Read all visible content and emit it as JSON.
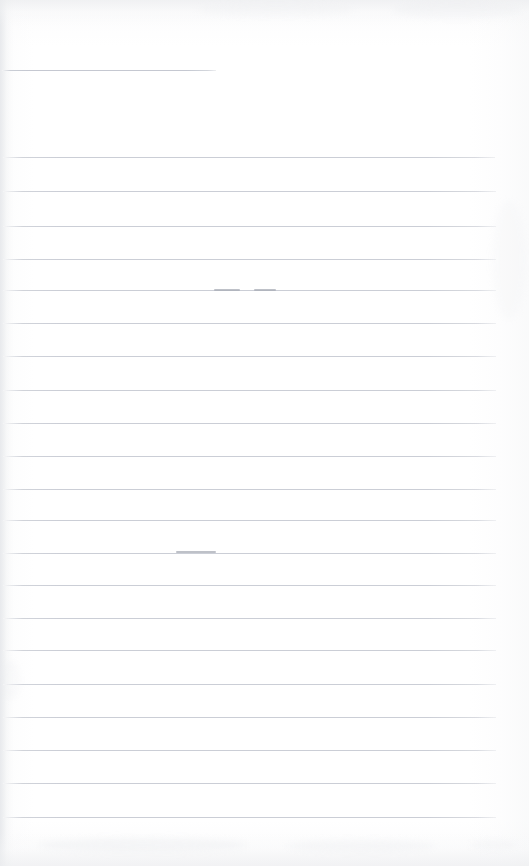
{
  "document": {
    "title": "Scanned ruled notebook page",
    "kind": "lined-paper-scan",
    "page_width": 529,
    "page_height": 866,
    "text_content": "",
    "has_handwriting": false,
    "note": ""
  },
  "colors": {
    "paper": "#fefeff",
    "rule_line": "#c9ccd4",
    "rule_line_short": "#c2c6cf",
    "pencil_mark": "#a8acb5",
    "scan_band": "#ecedef",
    "gutter_shadow": "#e5e7ea"
  },
  "layout": {
    "rule_left": 4,
    "rule_right": 496,
    "rule_thickness": 1,
    "line_spacing": 33
  },
  "rules": [
    {
      "id": "rule-header",
      "y": 70,
      "x": 2,
      "width": 214,
      "kind": "short"
    },
    {
      "id": "rule-1",
      "y": 157,
      "x": 3,
      "width": 492,
      "kind": "full"
    },
    {
      "id": "rule-2",
      "y": 191,
      "x": 3,
      "width": 493,
      "kind": "full"
    },
    {
      "id": "rule-3",
      "y": 226,
      "x": 3,
      "width": 493,
      "kind": "full"
    },
    {
      "id": "rule-4",
      "y": 259,
      "x": 3,
      "width": 493,
      "kind": "full"
    },
    {
      "id": "rule-5",
      "y": 290,
      "x": 3,
      "width": 493,
      "kind": "full"
    },
    {
      "id": "rule-6",
      "y": 323,
      "x": 3,
      "width": 493,
      "kind": "full"
    },
    {
      "id": "rule-7",
      "y": 356,
      "x": 3,
      "width": 493,
      "kind": "full"
    },
    {
      "id": "rule-8",
      "y": 390,
      "x": 3,
      "width": 493,
      "kind": "full"
    },
    {
      "id": "rule-9",
      "y": 423,
      "x": 3,
      "width": 493,
      "kind": "full"
    },
    {
      "id": "rule-10",
      "y": 456,
      "x": 3,
      "width": 493,
      "kind": "full"
    },
    {
      "id": "rule-11",
      "y": 489,
      "x": 3,
      "width": 493,
      "kind": "full"
    },
    {
      "id": "rule-12",
      "y": 520,
      "x": 3,
      "width": 493,
      "kind": "full"
    },
    {
      "id": "rule-13",
      "y": 553,
      "x": 3,
      "width": 493,
      "kind": "full"
    },
    {
      "id": "rule-14",
      "y": 585,
      "x": 3,
      "width": 493,
      "kind": "full"
    },
    {
      "id": "rule-15",
      "y": 618,
      "x": 3,
      "width": 493,
      "kind": "full"
    },
    {
      "id": "rule-16",
      "y": 650,
      "x": 3,
      "width": 493,
      "kind": "full"
    },
    {
      "id": "rule-17",
      "y": 684,
      "x": 3,
      "width": 493,
      "kind": "full"
    },
    {
      "id": "rule-18",
      "y": 717,
      "x": 3,
      "width": 493,
      "kind": "full"
    },
    {
      "id": "rule-19",
      "y": 750,
      "x": 3,
      "width": 493,
      "kind": "full"
    },
    {
      "id": "rule-20",
      "y": 783,
      "x": 3,
      "width": 493,
      "kind": "full"
    },
    {
      "id": "rule-21",
      "y": 817,
      "x": 3,
      "width": 493,
      "kind": "full"
    }
  ],
  "pencil_marks": [
    {
      "id": "mark-1",
      "x": 214,
      "y": 289,
      "width": 26
    },
    {
      "id": "mark-2",
      "x": 254,
      "y": 289,
      "width": 22
    },
    {
      "id": "mark-3",
      "x": 176,
      "y": 551,
      "width": 40
    }
  ],
  "smudges": [
    {
      "id": "smudge-1",
      "x": 38,
      "y": 838,
      "width": 210,
      "height": 14,
      "opacity": 0.5
    },
    {
      "id": "smudge-2",
      "x": 286,
      "y": 840,
      "width": 150,
      "height": 12,
      "opacity": 0.42
    },
    {
      "id": "smudge-3",
      "x": 470,
      "y": 840,
      "width": 46,
      "height": 10,
      "opacity": 0.35
    },
    {
      "id": "smudge-4",
      "x": 196,
      "y": 4,
      "width": 160,
      "height": 12,
      "opacity": 0.3
    },
    {
      "id": "smudge-5",
      "x": 392,
      "y": 2,
      "width": 130,
      "height": 16,
      "opacity": 0.38
    },
    {
      "id": "smudge-6",
      "x": 0,
      "y": 660,
      "width": 20,
      "height": 40,
      "opacity": 0.3
    },
    {
      "id": "smudge-7",
      "x": 492,
      "y": 200,
      "width": 34,
      "height": 120,
      "opacity": 0.22
    }
  ]
}
